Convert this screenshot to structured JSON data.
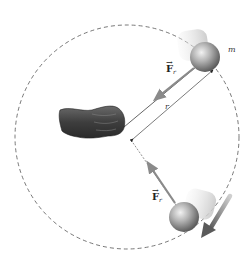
{
  "diagram": {
    "type": "uniform-circular-motion",
    "labels": {
      "mass": "m",
      "radius": "r",
      "force_top": {
        "symbol": "F",
        "subscript": "r",
        "vector_mark": "→"
      },
      "force_bottom": {
        "symbol": "F",
        "subscript": "r",
        "vector_mark": "→"
      }
    },
    "colors": {
      "background": "#ffffff",
      "dashed_path": "#555555",
      "string": "#555555",
      "force_arrow": "#8a8a8a",
      "velocity_arrow": "#7d7d7d",
      "ball_light": "#e6e6e6",
      "ball_dark": "#6e6e6e",
      "hand": "#4a4a4a"
    }
  }
}
